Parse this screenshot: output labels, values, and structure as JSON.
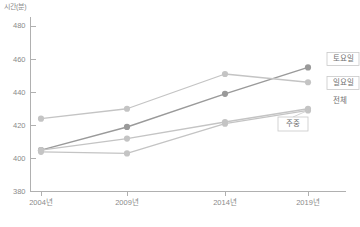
{
  "chart_data": {
    "type": "line",
    "title": "",
    "subtitle": "",
    "xlabel": "",
    "ylabel": "시간(분)",
    "categories": [
      "2004년",
      "2009년",
      "2014년",
      "2019년"
    ],
    "x": [
      2004,
      2009,
      2014,
      2019
    ],
    "ylim": [
      380,
      480
    ],
    "yticks": [
      380,
      400,
      420,
      440,
      460,
      480
    ],
    "ytick_labels": [
      "380",
      "400",
      "420",
      "440",
      "460",
      "480"
    ],
    "grid": false,
    "legend_position": "right-inline-labels",
    "markers": true,
    "series": [
      {
        "name": "토요일",
        "values": [
          405,
          419,
          439,
          455
        ],
        "color": "#9a9a9a",
        "label_box": true
      },
      {
        "name": "일요일",
        "values": [
          424,
          430,
          451,
          446
        ],
        "color": "#c4c4c4",
        "label_box": true
      },
      {
        "name": "전체",
        "values": [
          405,
          412,
          422,
          430
        ],
        "color": "#c4c4c4",
        "label_box": false
      },
      {
        "name": "주중",
        "values": [
          404,
          403,
          421,
          429
        ],
        "color": "#c4c4c4",
        "label_box": true
      }
    ]
  },
  "axes": {
    "y_axis_title": "시간(분)"
  },
  "colors": {
    "axis": "#b0b0b0",
    "tick_text": "#8a8a8a",
    "legend_text": "#6f6f6f",
    "legend_border": "#c9c9c9",
    "background": "#ffffff",
    "series_dark": "#9a9a9a",
    "series_light": "#c4c4c4"
  }
}
